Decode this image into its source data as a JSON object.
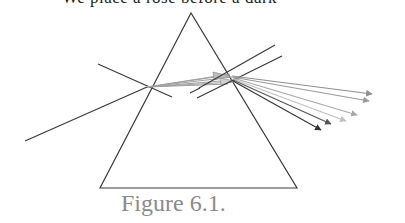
{
  "top_text": "We place a rose before a dark",
  "caption": "Figure 6.1.",
  "diagram": {
    "prism": {
      "apex": [
        191,
        13
      ],
      "bottom_left": [
        100,
        188
      ],
      "bottom_right": [
        297,
        188
      ]
    },
    "entry_point": [
      147,
      87
    ],
    "exit_point": [
      230,
      77
    ],
    "incident_ray": {
      "from": [
        25,
        141
      ],
      "to": [
        147,
        87
      ]
    },
    "entry_normal": {
      "from": [
        98,
        64
      ],
      "to": [
        172,
        97
      ]
    },
    "exit_normals": [
      {
        "from": [
          190,
          93
        ],
        "to": [
          275,
          45
        ]
      },
      {
        "from": [
          197,
          98
        ],
        "to": [
          282,
          56
        ]
      }
    ],
    "dispersed_rays": [
      {
        "to": [
          372,
          94
        ],
        "color": "#8f8f8f"
      },
      {
        "to": [
          369,
          101
        ],
        "color": "#9a9a9a"
      },
      {
        "to": [
          357,
          115
        ],
        "color": "#a8a8a8"
      },
      {
        "to": [
          346,
          121
        ],
        "color": "#b8b8b8"
      },
      {
        "to": [
          331,
          124
        ],
        "color": "#555555"
      },
      {
        "to": [
          321,
          130
        ],
        "color": "#3a3a3a"
      }
    ],
    "colors": {
      "line": "#3a3a3a",
      "internal_beam": "#9a9a9a",
      "caption": "#8a8a8a"
    }
  }
}
